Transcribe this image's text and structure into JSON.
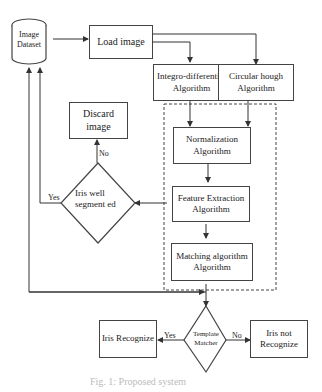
{
  "nodes": {
    "dataset": "Image Dataset",
    "load": "Load image",
    "integro": "Integro-differential Algorithm",
    "hough": "Circular hough Algorithm",
    "discard": "Discard image",
    "normalization": "Normalization Algorithm",
    "feature": "Feature Extraction Algorithm",
    "matching": "Matching algorithm Algorithm",
    "iris_seg": "Iris well segment ed",
    "template": "Template Matcher",
    "recognize": "Iris Recognize",
    "not_recognize": "Iris not Recognize"
  },
  "edges": {
    "yes1": "Yes",
    "no1": "No",
    "yes2": "Yes",
    "no2": "No"
  },
  "caption": "Fig. 1: Proposed system"
}
